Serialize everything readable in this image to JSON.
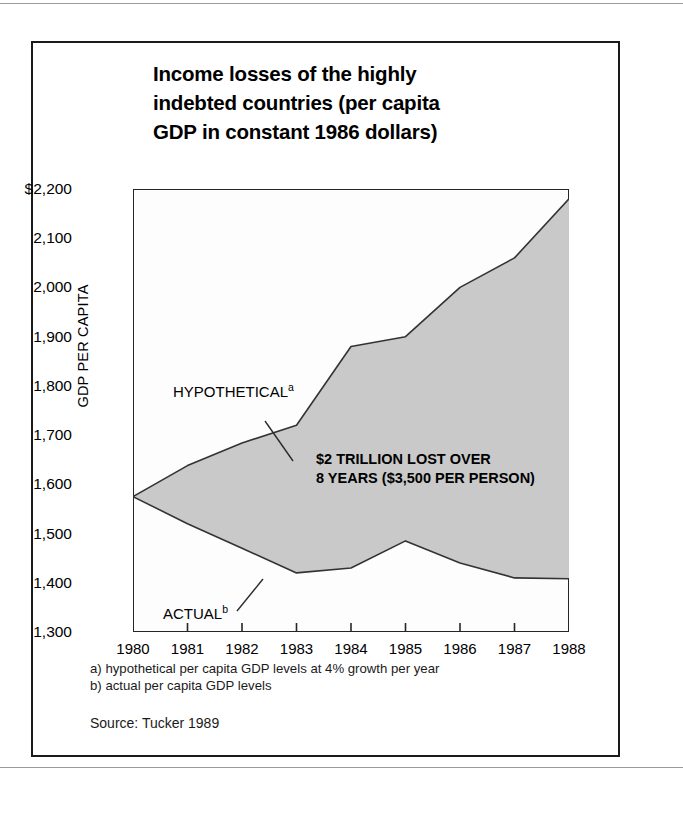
{
  "figure": {
    "title_lines": [
      "Income losses of the highly",
      "indebted countries (per capita",
      "GDP in constant 1986 dollars)"
    ],
    "y_axis_caption": "GDP PER CAPITA",
    "footnote_a": "a) hypothetical per capita GDP levels at 4% growth per year",
    "footnote_b": "b) actual per capita GDP levels",
    "source": "Source: Tucker 1989",
    "callout_lines": [
      "$2 TRILLION LOST OVER",
      "8 YEARS ($3,500 PER PERSON)"
    ],
    "label_hypothetical": "HYPOTHETICAL",
    "label_hypothetical_marker": "a",
    "label_actual": "ACTUAL",
    "label_actual_marker": "b"
  },
  "chart_data": {
    "type": "area",
    "title": "Income losses of the highly indebted countries (per capita GDP in constant 1986 dollars)",
    "xlabel": "",
    "ylabel": "GDP PER CAPITA",
    "x": [
      1980,
      1981,
      1982,
      1983,
      1984,
      1985,
      1986,
      1987,
      1988
    ],
    "xtick_labels": [
      "1980",
      "1981",
      "1982",
      "1983",
      "1984",
      "1985",
      "1986",
      "1987",
      "1988"
    ],
    "ytick_labels": [
      "$2,200",
      "2,100",
      "2,000",
      "1,900",
      "1,800",
      "1,700",
      "1,600",
      "1,500",
      "1,400",
      "1,300"
    ],
    "ytick_values": [
      2200,
      2100,
      2000,
      1900,
      1800,
      1700,
      1600,
      1500,
      1400,
      1300
    ],
    "ylim": [
      1300,
      2200
    ],
    "xlim": [
      1980,
      1988
    ],
    "grid": false,
    "legend_position": "inline-annotations",
    "fill_color": "#c9c9c9",
    "line_color": "#333333",
    "series": [
      {
        "name": "HYPOTHETICAL",
        "footnote": "a",
        "values": [
          1575,
          1638,
          1684,
          1720,
          1880,
          1900,
          2000,
          2060,
          2180
        ]
      },
      {
        "name": "ACTUAL",
        "footnote": "b",
        "values": [
          1575,
          1520,
          1470,
          1420,
          1430,
          1485,
          1440,
          1410,
          1408
        ]
      }
    ],
    "annotations": [
      "$2 TRILLION LOST OVER",
      "8 YEARS ($3,500 PER PERSON)"
    ]
  }
}
